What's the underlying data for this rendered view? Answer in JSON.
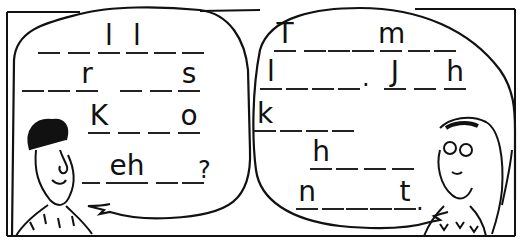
{
  "scene": {
    "description": "Two-panel cartoon with fill-in-the-blank speech bubbles",
    "colors": {
      "ink": "#111111",
      "paper": "#ffffff"
    }
  },
  "left_bubble": {
    "speaker": "man",
    "rows": [
      {
        "slots": [
          "",
          "",
          "l",
          "l",
          "",
          ""
        ],
        "end": ""
      },
      {
        "slots": [
          "",
          "",
          "r",
          "",
          "",
          "s"
        ],
        "end": ""
      },
      {
        "slots": [
          "K",
          "",
          "",
          "o"
        ],
        "end": ""
      },
      {
        "slots": [
          "",
          "eh",
          "",
          ""
        ],
        "end": "?"
      }
    ]
  },
  "right_bubble": {
    "speaker": "woman",
    "rows": [
      {
        "slots": [
          "T",
          "",
          "",
          "",
          " ",
          "m",
          "",
          ""
        ],
        "end": ""
      },
      {
        "slots": [
          "l",
          "",
          "",
          "",
          "",
          ".",
          "J",
          "",
          "h"
        ],
        "end": ""
      },
      {
        "slots": [
          "k",
          "",
          "",
          ""
        ],
        "end": ""
      },
      {
        "slots": [
          "h",
          "",
          "",
          ""
        ],
        "end": ""
      },
      {
        "slots": [
          "n",
          "",
          "",
          "",
          "",
          "t"
        ],
        "end": "."
      }
    ]
  },
  "puzzle_letters": {
    "left": [
      "l",
      "l",
      "r",
      "s",
      "K",
      "o",
      "eh",
      "?"
    ],
    "right": [
      "T",
      "m",
      "l",
      ".",
      "J",
      "h",
      "k",
      "h",
      "n",
      "t",
      "."
    ]
  }
}
